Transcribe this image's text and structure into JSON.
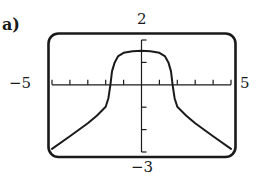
{
  "figure": {
    "part_label": "a)",
    "window_labels": {
      "xmin": "−5",
      "xmax": "5",
      "ymin": "−3",
      "ymax": "2"
    },
    "colors": {
      "ink": "#1a1a1a",
      "background": "#ffffff"
    }
  },
  "chart_data": {
    "type": "line",
    "title": "a)",
    "xlabel": "",
    "ylabel": "",
    "xlim": [
      -5,
      5
    ],
    "ylim": [
      -3,
      2
    ],
    "x_ticks": [
      -5,
      -4,
      -3,
      -2,
      -1,
      0,
      1,
      2,
      3,
      4,
      5
    ],
    "y_ticks": [
      -3,
      -2,
      -1,
      0,
      1,
      2
    ],
    "tick_labels": {
      "x": [
        "−5",
        "5"
      ],
      "y": [
        "−3",
        "2"
      ]
    },
    "grid": false,
    "legend": null,
    "frame": "rounded-rectangle (graphing calculator window)",
    "series": [
      {
        "name": "f(x)",
        "symmetric_about_y_axis": true,
        "x": [
          -5,
          -4,
          -3,
          -2.5,
          -2,
          -1.85,
          -1.74,
          -1.65,
          -1.5,
          -1.3,
          -1,
          -0.5,
          0,
          0.5,
          1,
          1.3,
          1.5,
          1.65,
          1.74,
          1.85,
          2,
          2.5,
          3,
          4,
          5
        ],
        "y": [
          -2.86,
          -2.3,
          -1.72,
          -1.38,
          -0.98,
          -0.6,
          0,
          0.6,
          1.0,
          1.28,
          1.43,
          1.5,
          1.52,
          1.5,
          1.43,
          1.28,
          1.0,
          0.6,
          0,
          -0.6,
          -0.98,
          -1.38,
          -1.72,
          -2.3,
          -2.86
        ]
      }
    ]
  }
}
